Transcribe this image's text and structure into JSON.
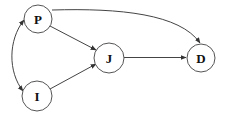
{
  "diagram": {
    "type": "directed-graph",
    "nodes": [
      {
        "id": "P",
        "label": "P",
        "cx": 38,
        "cy": 19,
        "r": 14
      },
      {
        "id": "I",
        "label": "I",
        "cx": 37,
        "cy": 96,
        "r": 15
      },
      {
        "id": "J",
        "label": "J",
        "cx": 109,
        "cy": 58,
        "r": 15
      },
      {
        "id": "D",
        "label": "D",
        "cx": 201,
        "cy": 58,
        "r": 14
      }
    ],
    "edges": [
      {
        "from": "P",
        "to": "J",
        "type": "directed"
      },
      {
        "from": "I",
        "to": "J",
        "type": "directed"
      },
      {
        "from": "J",
        "to": "D",
        "type": "directed"
      },
      {
        "from": "P",
        "to": "D",
        "type": "directed",
        "curved": true
      },
      {
        "from": "P",
        "to": "I",
        "type": "bidirectional",
        "curved": true
      }
    ],
    "colors": {
      "stroke": "#444444",
      "node_fill": "#ffffff",
      "label": "#111111"
    }
  }
}
